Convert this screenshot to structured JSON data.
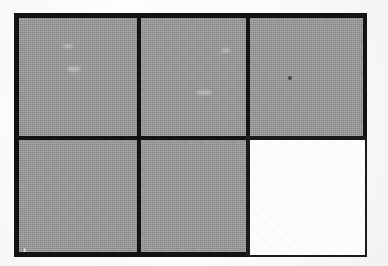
{
  "figure": {
    "kind": "grid-diagram",
    "caption": "",
    "background_color": "#fdfdfd",
    "border_color": "#131313",
    "fill_color": "#9c9c9c",
    "empty_color": "#ffffff",
    "rows": 2,
    "columns": 3,
    "filled_count": 5,
    "empty_count": 1
  },
  "grid": {
    "cells": [
      {
        "id": "r1c1",
        "row": 1,
        "column": 1,
        "state": "filled",
        "fill": "#9c9c9c",
        "label": ""
      },
      {
        "id": "r1c2",
        "row": 1,
        "column": 2,
        "state": "filled",
        "fill": "#9c9c9c",
        "label": ""
      },
      {
        "id": "r1c3",
        "row": 1,
        "column": 3,
        "state": "filled",
        "fill": "#9c9c9c",
        "label": ""
      },
      {
        "id": "r2c1",
        "row": 2,
        "column": 1,
        "state": "filled",
        "fill": "#9c9c9c",
        "label": ""
      },
      {
        "id": "r2c2",
        "row": 2,
        "column": 2,
        "state": "filled",
        "fill": "#9c9c9c",
        "label": ""
      },
      {
        "id": "r2c3",
        "row": 2,
        "column": 3,
        "state": "empty",
        "fill": "#ffffff",
        "label": ""
      }
    ]
  },
  "marks": [
    {
      "id": "speck-top-right",
      "type": "dark-speck",
      "cell": "r1c3"
    },
    {
      "id": "crescent-bottom-left",
      "type": "light-crescent",
      "cell": "r2c1"
    }
  ]
}
